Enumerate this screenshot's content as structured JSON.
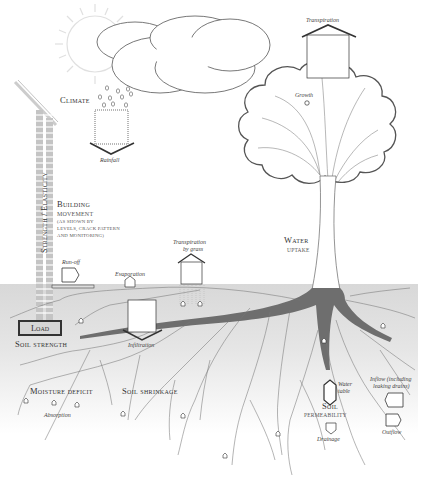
{
  "diagram": {
    "colors": {
      "soil": "#dcdcdc",
      "line": "#333333",
      "root": "#6e6e6e",
      "sun": "#e2e2e2",
      "background": "#ffffff"
    },
    "labels": {
      "climate": "Climate",
      "rainfall": "Rainfall",
      "transpiration": "Transpiration",
      "growth": "Growth",
      "strength_elasticity": "Strength / Elasticity",
      "building_movement_line1": "Building",
      "building_movement_line2": "movement",
      "building_movement_note1": "(as shown by",
      "building_movement_note2": "levels, crack pattern",
      "building_movement_note3": "and monitoring)",
      "water_uptake_line1": "Water",
      "water_uptake_line2": "uptake",
      "run_off": "Run-off",
      "evaporation": "Evaporation",
      "transpiration_by_grass_line1": "Transpiration",
      "transpiration_by_grass_line2": "by grass",
      "load": "Load",
      "soil_strength": "Soil strength",
      "infiltration": "Infiltration",
      "moisture_deficit": "Moisture deficit",
      "absorption": "Absorption",
      "soil_shrinkage": "Soil shrinkage",
      "water_table_line1": "Water",
      "water_table_line2": "table",
      "soil_permeability_line1": "Soil",
      "soil_permeability_line2": "permeability",
      "drainage": "Drainage",
      "inflow_line1": "Inflow (including",
      "inflow_line2": "leaking drains)",
      "outflow": "Outflow"
    },
    "icons": [
      "sun-icon",
      "cloud-icon",
      "raindrop-icon",
      "rainfall-arrow-icon",
      "transpiration-arrow-icon",
      "tree-icon",
      "building-wall-icon",
      "run-off-arrow-icon",
      "evaporation-arrow-icon",
      "grass-transpiration-arrow-icon",
      "infiltration-arrow-icon",
      "root-system-icon",
      "water-table-arrow-icon",
      "drainage-arrow-icon",
      "inflow-arrow-icon",
      "outflow-arrow-icon",
      "moisture-pocket-icon"
    ]
  }
}
